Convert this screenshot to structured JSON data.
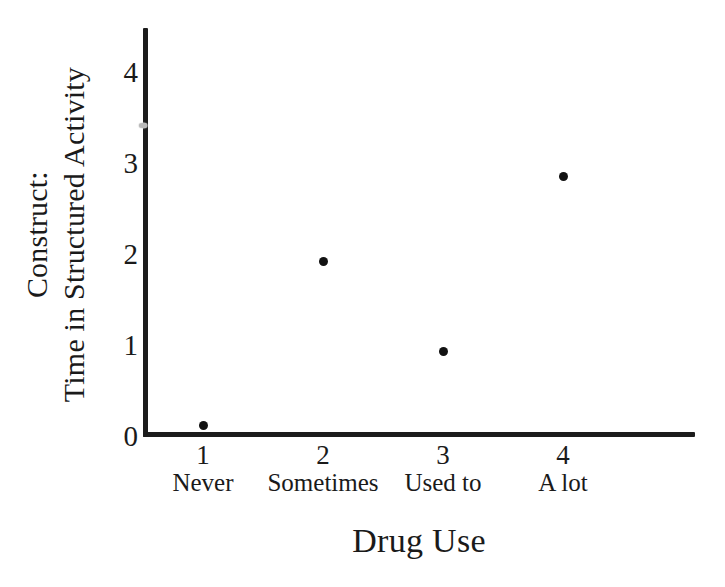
{
  "chart_data": {
    "type": "scatter",
    "title": "",
    "xlabel": "Drug Use",
    "ylabel_line1": "Construct:",
    "ylabel_line2": "Time in Structured Activity",
    "x": [
      1,
      2,
      3,
      4
    ],
    "categories": [
      "Never",
      "Sometimes",
      "Used to",
      "A lot"
    ],
    "xtick_labels": [
      "1",
      "2",
      "3",
      "4"
    ],
    "ytick_labels": [
      "0",
      "1",
      "2",
      "3",
      "4"
    ],
    "yticks": [
      0,
      1,
      2,
      3,
      4
    ],
    "xlim": [
      0.5,
      5.1
    ],
    "ylim": [
      0,
      4.5
    ],
    "grid": false,
    "legend": "none",
    "values": [
      0.13,
      1.93,
      0.94,
      2.87
    ],
    "points": [
      {
        "name": "point-never",
        "x": 1,
        "y": 0.13,
        "category": "Never",
        "faint": false
      },
      {
        "name": "point-sometimes",
        "x": 2,
        "y": 1.93,
        "category": "Sometimes",
        "faint": false
      },
      {
        "name": "point-used-to",
        "x": 3,
        "y": 0.94,
        "category": "Used to",
        "faint": false
      },
      {
        "name": "point-a-lot",
        "x": 4,
        "y": 2.87,
        "category": "A lot",
        "faint": false
      },
      {
        "name": "point-faint-stray",
        "x": 0.5,
        "y": 3.43,
        "category": "",
        "faint": true
      }
    ],
    "marker_color": "#121212",
    "faint_marker_color": "#b9b9b9",
    "axis_color": "#1c1c1c",
    "background_color": "#ffffff"
  }
}
